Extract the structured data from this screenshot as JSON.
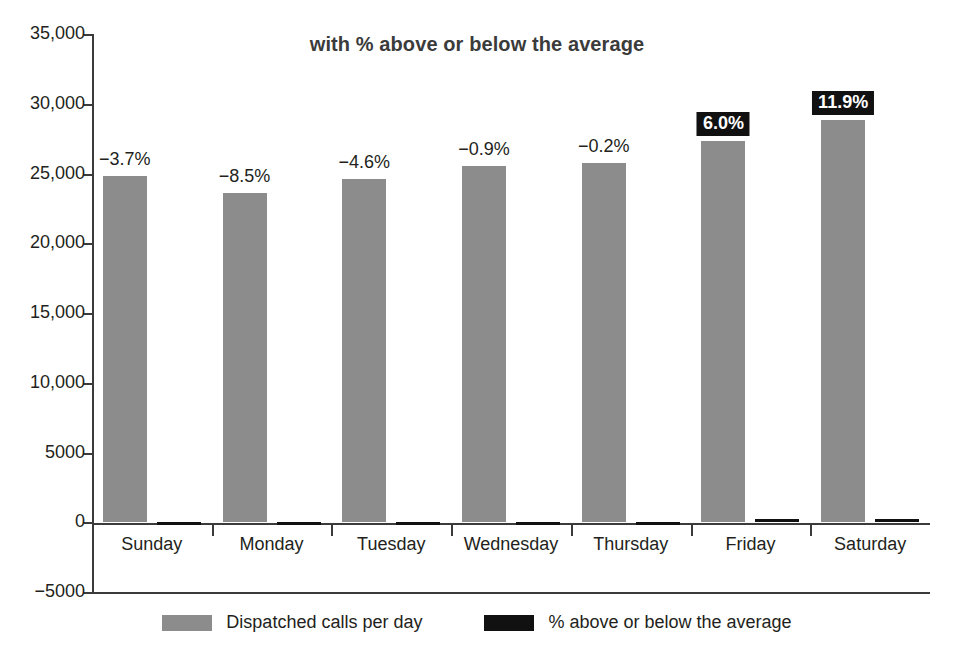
{
  "chart_data": {
    "type": "bar",
    "title": "with % above or below the average",
    "xlabel": "",
    "ylabel": "",
    "ylim": [
      -5000,
      35000
    ],
    "ytick_labels": [
      "35,000",
      "30,000",
      "25,000",
      "20,000",
      "15,000",
      "10,000",
      "5000",
      "0",
      "−5000"
    ],
    "ytick_values": [
      35000,
      30000,
      25000,
      20000,
      15000,
      10000,
      5000,
      0,
      -5000
    ],
    "grid": false,
    "legend_position": "bottom",
    "categories": [
      "Sunday",
      "Monday",
      "Tuesday",
      "Wednesday",
      "Thursday",
      "Friday",
      "Saturday"
    ],
    "series": [
      {
        "name": "Dispatched calls per day",
        "color": "#8c8c8c",
        "values": [
          24845,
          23600,
          24610,
          25570,
          25750,
          27350,
          28870
        ]
      },
      {
        "name": "% above or below the average",
        "color": "#111111",
        "values": [
          -3.7,
          -8.5,
          -4.6,
          -0.9,
          -0.2,
          6.0,
          11.9
        ]
      }
    ],
    "data_labels": [
      {
        "text": "−3.7%",
        "highlight": false
      },
      {
        "text": "−8.5%",
        "highlight": false
      },
      {
        "text": "−4.6%",
        "highlight": false
      },
      {
        "text": "−0.9%",
        "highlight": false
      },
      {
        "text": "−0.2%",
        "highlight": false
      },
      {
        "text": "6.0%",
        "highlight": true
      },
      {
        "text": "11.9%",
        "highlight": true
      }
    ],
    "legend": [
      {
        "label": "Dispatched calls per day",
        "color": "#8c8c8c"
      },
      {
        "label": "% above or below the average",
        "color": "#111111"
      }
    ]
  }
}
